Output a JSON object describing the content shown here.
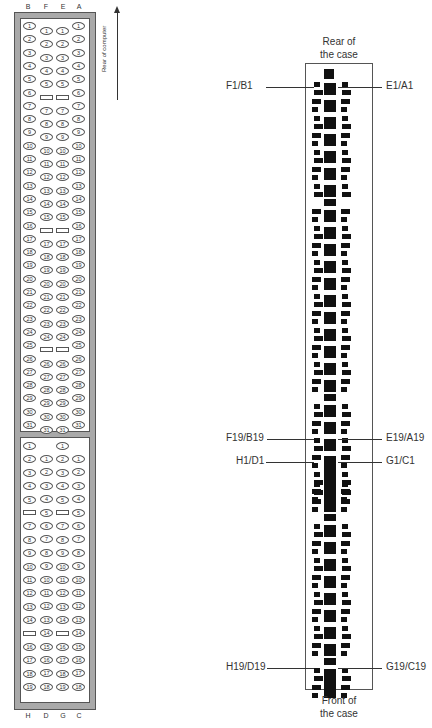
{
  "left_diagram": {
    "top_column_letters": [
      "B",
      "F",
      "E",
      "A"
    ],
    "bottom_column_letters": [
      "H",
      "D",
      "G",
      "C"
    ],
    "orientation_label": "Rear of computer",
    "orientation_arrow": "up-arrow-icon",
    "upper_block": {
      "outer_columns": [
        "B",
        "A"
      ],
      "inner_columns": [
        "F",
        "E"
      ],
      "outer_pins": [
        "1",
        "2",
        "3",
        "4",
        "5",
        "6",
        "7",
        "8",
        "9",
        "10",
        "11",
        "12",
        "13",
        "14",
        "15",
        "16",
        "17",
        "18",
        "19",
        "20",
        "21",
        "22",
        "23",
        "24",
        "25",
        "26",
        "27",
        "28",
        "29",
        "30",
        "31"
      ],
      "inner_pins": [
        "1",
        "2",
        "3",
        "4",
        "5",
        "blank",
        "7",
        "8",
        "9",
        "10",
        "11",
        "12",
        "13",
        "14",
        "15",
        "blank",
        "17",
        "18",
        "19",
        "20",
        "21",
        "22",
        "23",
        "24",
        "blank",
        "26",
        "27",
        "28",
        "29",
        "30",
        "31"
      ]
    },
    "lower_block": {
      "outer_columns_left": [
        "H",
        "G"
      ],
      "inner_columns_right": [
        "D",
        "C"
      ],
      "left_pins": [
        "1",
        "2",
        "3",
        "4",
        "5",
        "blank",
        "7",
        "8",
        "9",
        "10",
        "11",
        "12",
        "13",
        "14",
        "blank",
        "16",
        "17",
        "18",
        "19"
      ],
      "right_pins": [
        "1",
        "2",
        "3",
        "4",
        "5",
        "6",
        "7",
        "8",
        "9",
        "10",
        "11",
        "12",
        "13",
        "14",
        "15",
        "16",
        "17",
        "18"
      ]
    }
  },
  "right_diagram": {
    "top_caption": [
      "Rear of",
      "the case"
    ],
    "bottom_caption": [
      "Front of",
      "the case"
    ],
    "labels": {
      "f1_b1": "F1/B1",
      "e1_a1": "E1/A1",
      "f19_b19": "F19/B19",
      "e19_a19": "E19/A19",
      "h1_d1": "H1/D1",
      "g1_c1": "G1/C1",
      "h19_d19": "H19/D19",
      "g19_c19": "G19/C19"
    }
  },
  "colors": {
    "frame_gray": "#a9a9a9",
    "pin_black": "#111111",
    "line": "#333333"
  }
}
